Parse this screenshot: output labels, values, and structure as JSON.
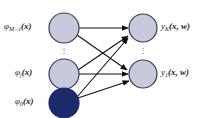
{
  "figure": {
    "background_color": "#ffffff",
    "node_fill_light": "#c9c9dd",
    "node_fill_dark": "#1b2a6b",
    "node_stroke": "#3a3a52",
    "edge_color": "#111111"
  },
  "input_layer": {
    "nodes": [
      {
        "id": "phi-M-1",
        "label_base": "φ",
        "label_sub": "M−1",
        "label_arg": "(x)",
        "fill": "light",
        "cx": 64,
        "cy": 28,
        "r": 15
      },
      {
        "id": "phi-j",
        "label_base": "φ",
        "label_sub": "j",
        "label_arg": "(x)",
        "fill": "light",
        "cx": 64,
        "cy": 74,
        "r": 15
      },
      {
        "id": "phi-0",
        "label_base": "φ",
        "label_sub": "0",
        "label_arg": "(x)",
        "fill": "dark",
        "cx": 64,
        "cy": 103,
        "r": 15
      }
    ],
    "labels": [
      {
        "text": "φ",
        "sub": "M−1",
        "arg": "(x)",
        "x": 4,
        "y": 23
      },
      {
        "text": "φ",
        "sub": "j",
        "arg": "(x)",
        "x": 15,
        "y": 69
      },
      {
        "text": "φ",
        "sub": "0",
        "arg": "(x)",
        "x": 15,
        "y": 98
      }
    ],
    "ellipsis": {
      "x": 61,
      "y": 48,
      "dots": [
        "·",
        "·",
        "·"
      ]
    }
  },
  "output_layer": {
    "nodes": [
      {
        "id": "y-K",
        "label_base": "y",
        "label_sub": "K",
        "label_arg": "(x,w)",
        "fill": "light",
        "cx": 143,
        "cy": 28,
        "r": 14
      },
      {
        "id": "y-1",
        "label_base": "y",
        "label_sub": "1",
        "label_arg": "(x,w)",
        "fill": "light",
        "cx": 143,
        "cy": 74,
        "r": 14
      }
    ],
    "labels": [
      {
        "text": "y",
        "sub": "K",
        "arg": "(x, w)",
        "x": 161,
        "y": 23
      },
      {
        "text": "y",
        "sub": "1",
        "arg": "(x, w)",
        "x": 161,
        "y": 69
      }
    ],
    "ellipsis": {
      "x": 140,
      "y": 48,
      "dots": [
        "·",
        "·",
        "·"
      ]
    }
  },
  "edges": [
    {
      "from": "phi-M-1",
      "to": "y-K"
    },
    {
      "from": "phi-M-1",
      "to": "y-1"
    },
    {
      "from": "phi-j",
      "to": "y-K"
    },
    {
      "from": "phi-j",
      "to": "y-1"
    },
    {
      "from": "phi-0",
      "to": "y-K"
    },
    {
      "from": "phi-0",
      "to": "y-1"
    }
  ]
}
